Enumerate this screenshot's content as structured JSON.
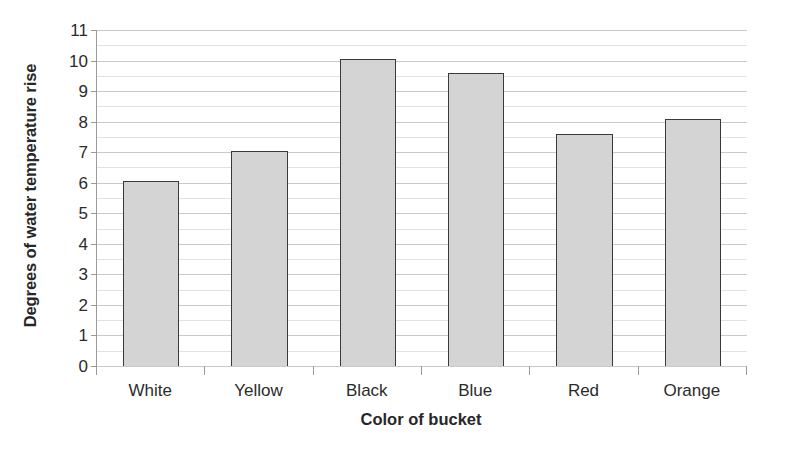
{
  "chart_data": {
    "type": "bar",
    "title": "",
    "categories": [
      "White",
      "Yellow",
      "Black",
      "Blue",
      "Red",
      "Orange"
    ],
    "values": [
      6.05,
      7.05,
      10.05,
      9.58,
      7.6,
      8.08
    ],
    "series": [
      {
        "name": "Degrees of water temperature rise",
        "values": [
          6.05,
          7.05,
          10.05,
          9.58,
          7.6,
          8.08
        ]
      }
    ],
    "xlabel": "Color of bucket",
    "ylabel": "Degrees of water temperature rise",
    "ylim": [
      0,
      11
    ],
    "y_major_step": 1,
    "y_minor_step": 0.5,
    "y_tick_labels": [
      "0",
      "1",
      "2",
      "3",
      "4",
      "5",
      "6",
      "7",
      "8",
      "9",
      "10",
      "11"
    ],
    "grid": true,
    "grid_axis": "y",
    "legend": false,
    "legend_position": "none",
    "bar_fill_color": "#d4d4d4",
    "bar_edge_color": "#3a3a3a",
    "gridline_color": "#c9c9c9",
    "minor_gridline_color": "#e2e2e2",
    "axis_color": "#9a9a9a",
    "text_color": "#2b2b2b",
    "background_color": "#ffffff"
  }
}
